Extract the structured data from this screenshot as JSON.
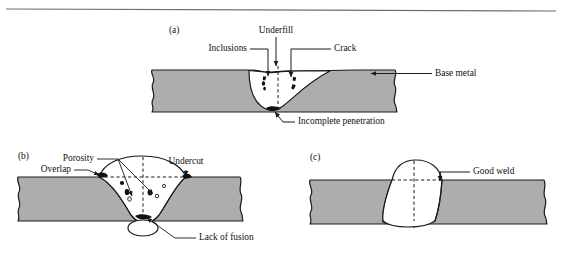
{
  "figure": {
    "background_color": "#ffffff",
    "metal_fill_color": "#adadad",
    "weld_fill_color": "#ffffff",
    "line_color": "#1a1a1a",
    "top_rule": true
  },
  "panels": [
    {
      "id": "a",
      "label": "(a)",
      "description": "Weld with multiple discontinuities",
      "callouts": [
        {
          "name": "underfill",
          "text": "Underfill"
        },
        {
          "name": "inclusions",
          "text": "Inclusions"
        },
        {
          "name": "crack",
          "text": "Crack"
        },
        {
          "name": "base-metal",
          "text": "Base metal"
        },
        {
          "name": "incomplete-penetration",
          "text": "Incomplete penetration"
        }
      ]
    },
    {
      "id": "b",
      "label": "(b)",
      "description": "Weld with overlap, porosity, undercut and lack of fusion",
      "callouts": [
        {
          "name": "porosity",
          "text": "Porosity"
        },
        {
          "name": "overlap",
          "text": "Overlap"
        },
        {
          "name": "undercut",
          "text": "Undercut"
        },
        {
          "name": "lack-of-fusion",
          "text": "Lack of fusion"
        }
      ]
    },
    {
      "id": "c",
      "label": "(c)",
      "description": "Acceptable weld profile",
      "callouts": [
        {
          "name": "good-weld",
          "text": "Good weld"
        }
      ]
    }
  ],
  "labels": {
    "panel_a": "(a)",
    "panel_b": "(b)",
    "panel_c": "(c)",
    "underfill": "Underfill",
    "inclusions": "Inclusions",
    "crack": "Crack",
    "base_metal": "Base metal",
    "incomplete_penetration": "Incomplete penetration",
    "porosity": "Porosity",
    "overlap": "Overlap",
    "undercut": "Undercut",
    "lack_of_fusion": "Lack of fusion",
    "good_weld": "Good weld"
  }
}
